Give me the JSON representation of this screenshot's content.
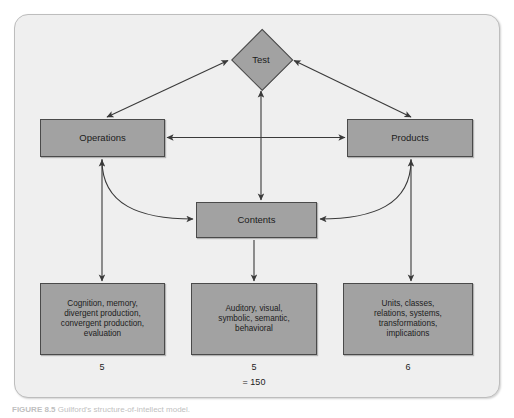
{
  "figure": {
    "caption_number": "FIGURE 8.5",
    "caption_text": "Guilford's structure-of-intellect model."
  },
  "diagram": {
    "type": "structure-of-intellect model",
    "nodes": {
      "test": {
        "label": "Test",
        "shape": "diamond"
      },
      "operations": {
        "label": "Operations",
        "shape": "rectangle"
      },
      "products": {
        "label": "Products",
        "shape": "rectangle"
      },
      "contents": {
        "label": "Contents",
        "shape": "rectangle"
      }
    },
    "categories": [
      {
        "id": "operations",
        "parent": "Operations",
        "items": [
          "Cognition, memory,",
          "divergent production,",
          "convergent production,",
          "evaluation"
        ],
        "count": "5"
      },
      {
        "id": "contents",
        "parent": "Contents",
        "items": [
          "Auditory, visual,",
          "symbolic, semantic,",
          "behavioral"
        ],
        "count": "5",
        "total": "= 150"
      },
      {
        "id": "products",
        "parent": "Products",
        "items": [
          "Units, classes,",
          "relations, systems,",
          "transformations,",
          "implications"
        ],
        "count": "6"
      }
    ],
    "colors": {
      "node_fill": "#a2a2a2",
      "node_border": "#4a4a4a",
      "frame_background": "#efefef",
      "frame_border": "#bdbdbd",
      "connector": "#3a3a3a"
    }
  }
}
